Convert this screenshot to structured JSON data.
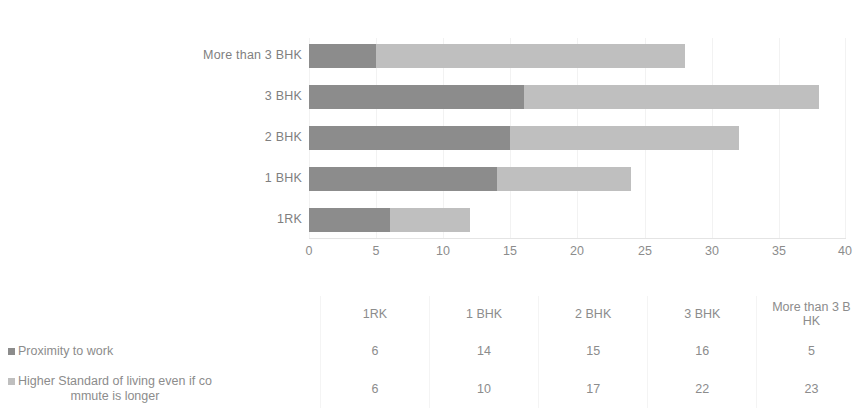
{
  "chart_data": {
    "type": "bar",
    "orientation": "horizontal",
    "stacked": true,
    "title": "",
    "xlabel": "",
    "ylabel": "",
    "categories": [
      "1RK",
      "1 BHK",
      "2 BHK",
      "3 BHK",
      "More than 3 BHK"
    ],
    "plot_category_order_top_to_bottom": [
      "More than 3 BHK",
      "3 BHK",
      "2 BHK",
      "1 BHK",
      "1RK"
    ],
    "series": [
      {
        "name": "Proximity to work",
        "color": "#8c8c8c",
        "values": [
          6,
          14,
          15,
          16,
          5
        ]
      },
      {
        "name": "Higher Standard of living even if commute is longer",
        "color": "#bfbfbf",
        "values": [
          6,
          10,
          17,
          22,
          23
        ]
      }
    ],
    "totals": [
      12,
      24,
      32,
      38,
      28
    ],
    "xlim": [
      0,
      40
    ],
    "xticks": [
      0,
      5,
      10,
      15,
      20,
      25,
      30,
      35,
      40
    ],
    "xtick_labels": [
      "0",
      "5",
      "10",
      "15",
      "20",
      "25",
      "30",
      "35",
      "40"
    ],
    "grid": true,
    "legend_position": "bottom-left-table"
  },
  "axis": {
    "ticks": [
      "0",
      "5",
      "10",
      "15",
      "20",
      "25",
      "30",
      "35",
      "40"
    ],
    "max": 40
  },
  "plot": {
    "categories": [
      {
        "label": "More than 3 BHK",
        "a": 5,
        "b": 23
      },
      {
        "label": "3 BHK",
        "a": 16,
        "b": 22
      },
      {
        "label": "2 BHK",
        "a": 15,
        "b": 17
      },
      {
        "label": "1 BHK",
        "a": 14,
        "b": 10
      },
      {
        "label": "1RK",
        "a": 6,
        "b": 6
      }
    ]
  },
  "table": {
    "headers": [
      "1RK",
      "1 BHK",
      "2 BHK",
      "3 BHK",
      "More than 3 B HK"
    ],
    "header_last_line1": "More than 3 B",
    "header_last_line2": "HK",
    "rows": [
      {
        "legend_label": "Proximity to work",
        "swatch": "#8c8c8c",
        "values": [
          "6",
          "14",
          "15",
          "16",
          "5"
        ]
      },
      {
        "legend_label_line1": "Higher Standard of living even if co",
        "legend_label_line2": "mmute is longer",
        "swatch": "#bfbfbf",
        "values": [
          "6",
          "10",
          "17",
          "22",
          "23"
        ]
      }
    ]
  },
  "colors": {
    "series_a": "#8c8c8c",
    "series_b": "#bfbfbf",
    "text": "#808080",
    "gridline": "#f2f2f2",
    "background": "#ffffff"
  }
}
